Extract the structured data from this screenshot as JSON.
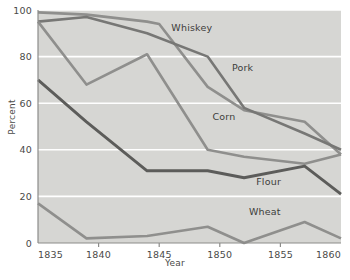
{
  "chart_data": {
    "type": "line",
    "title": "",
    "xlabel": "Year",
    "ylabel": "Percent",
    "xlim": [
      1835,
      1860
    ],
    "ylim": [
      0,
      100
    ],
    "xticks": [
      1835,
      1840,
      1845,
      1850,
      1855,
      1860
    ],
    "yticks": [
      0,
      20,
      40,
      60,
      80,
      100
    ],
    "grid": "horizontal",
    "legend_position": "inline-labels",
    "plot_background": "#d6d6d3",
    "figure_background": "#ffffff",
    "series": [
      {
        "name": "Whiskey",
        "color": "#8f8f8d",
        "width": 2.6,
        "label_x": 1846.0,
        "label_y": 91,
        "x": [
          1835,
          1839,
          1844,
          1845,
          1849,
          1852,
          1857,
          1860
        ],
        "values": [
          99,
          98,
          95,
          94,
          67,
          57,
          52,
          38
        ]
      },
      {
        "name": "Pork",
        "color": "#777775",
        "width": 2.6,
        "label_x": 1851.0,
        "label_y": 74,
        "x": [
          1835,
          1839,
          1844,
          1849,
          1852,
          1857,
          1860
        ],
        "values": [
          95,
          97,
          90,
          80,
          58,
          47,
          40
        ]
      },
      {
        "name": "Corn",
        "color": "#8f8f8d",
        "width": 2.6,
        "label_x": 1849.4,
        "label_y": 53,
        "x": [
          1835,
          1839,
          1844,
          1849,
          1852,
          1857,
          1860
        ],
        "values": [
          95,
          68,
          81,
          40,
          37,
          34,
          38
        ]
      },
      {
        "name": "Flour",
        "color": "#5c5c5a",
        "width": 2.9,
        "label_x": 1853.0,
        "label_y": 25,
        "x": [
          1835,
          1839,
          1844,
          1849,
          1852,
          1857,
          1860
        ],
        "values": [
          70,
          52,
          31,
          31,
          28,
          33,
          21
        ]
      },
      {
        "name": "Wheat",
        "color": "#8f8f8d",
        "width": 2.6,
        "label_x": 1852.4,
        "label_y": 12,
        "x": [
          1835,
          1839,
          1844,
          1849,
          1852,
          1857,
          1860
        ],
        "values": [
          17,
          2,
          3,
          7,
          0,
          9,
          2
        ]
      }
    ]
  }
}
